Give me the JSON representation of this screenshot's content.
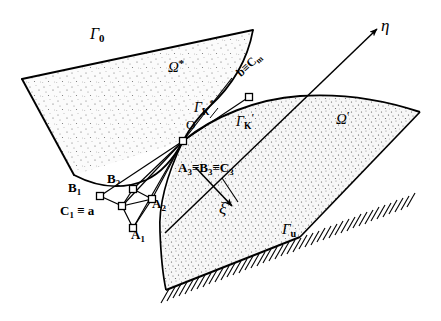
{
  "figure": {
    "kind": "geometry-diagram",
    "width": 441,
    "height": 321,
    "background": "#ffffff",
    "ink": "#000000",
    "stipple_fill": "#f2f2f2"
  },
  "labels": {
    "gamma_0": "Γ",
    "gamma_0_sub": "0",
    "omega_star": "Ω",
    "omega_star_sup": "*",
    "omega_prime": "Ω",
    "omega_prime_sup": "′",
    "gamma_k_star": "Γ",
    "gamma_k_star_sub": "K",
    "gamma_k_star_sup": "*",
    "gamma_k_prime": "Γ",
    "gamma_k_prime_sub": "K",
    "gamma_k_prime_sup": "′",
    "gamma_u": "Γ",
    "gamma_u_sub": "u",
    "origin": "O",
    "eta_axis": "η",
    "xi_axis": "ξ",
    "b_equiv_cm": "b≡C",
    "b_equiv_cm_sub": "m",
    "c1_equiv_a_head": "C",
    "c1_equiv_a_sub": "1",
    "c1_equiv_a_tail": "≡ a",
    "a1": "A",
    "a1_sub": "1",
    "a2": "A",
    "a2_sub": "2",
    "b1": "B",
    "b1_sub": "1",
    "b2": "B",
    "b2_sub": "2",
    "triple_a3": "A",
    "triple_a3_sub": "3",
    "triple_eq1": "≡",
    "triple_b3": "B",
    "triple_b3_sub": "3",
    "triple_eq2": "≡",
    "triple_c3": "C",
    "triple_c3_sub": "3"
  },
  "nodes": {
    "O": {
      "x": 183,
      "y": 141
    },
    "A1": {
      "x": 133,
      "y": 228
    },
    "A2": {
      "x": 152,
      "y": 199
    },
    "B1": {
      "x": 100,
      "y": 196
    },
    "B2": {
      "x": 133,
      "y": 189
    },
    "center_quad": {
      "x": 122,
      "y": 206
    },
    "Cm": {
      "x": 249,
      "y": 97
    }
  }
}
